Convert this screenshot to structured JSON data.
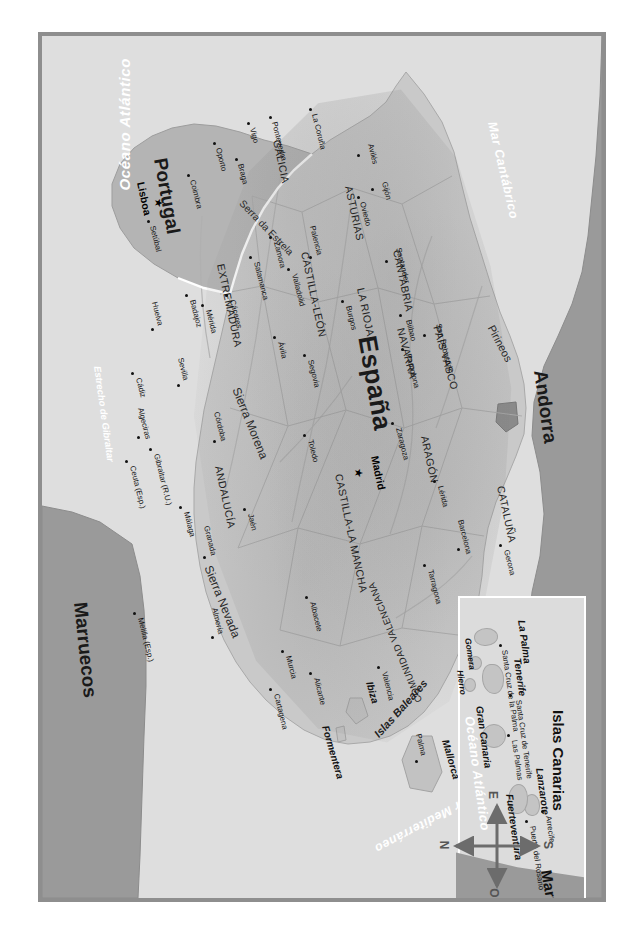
{
  "map": {
    "title": "Mapa físico-político de España y Portugal",
    "countries": [
      {
        "name": "España",
        "style": "country"
      },
      {
        "name": "Portugal",
        "style": "nation"
      },
      {
        "name": "Andorra",
        "style": "nation"
      },
      {
        "name": "Marruecos",
        "style": "nation"
      }
    ],
    "seas": [
      {
        "name": "Mar Cantábrico"
      },
      {
        "name": "Mar Mediterráneo"
      },
      {
        "name": "Océano Atlántico"
      },
      {
        "name": "Estrecho de Gibraltar"
      }
    ],
    "regions": [
      "GALICIA",
      "ASTURIAS",
      "CANTABRIA",
      "PAÍS VASCO",
      "NAVARRA",
      "LA RIOJA",
      "ARAGÓN",
      "CATALUÑA",
      "CASTILLA-LEÓN",
      "COMUNIDAD VALENCIANA",
      "EXTREMADURA",
      "CASTILLA-LA MANCHA",
      "ANDALUCÍA"
    ],
    "mountain_ranges": [
      "Pirineos",
      "Serra da Estrela",
      "Sierra Morena",
      "Sierra Nevada"
    ],
    "capitals": [
      {
        "name": "Madrid",
        "country": "España"
      },
      {
        "name": "Lisboa",
        "country": "Portugal"
      }
    ],
    "cities": [
      "La Coruña",
      "Pontevedra",
      "Vigo",
      "Oporto",
      "Braga",
      "Coimbra",
      "Setúbal",
      "Avilés",
      "Gijón",
      "Oviedo",
      "Santander",
      "San Sebastián",
      "Bilbao",
      "Pamplona",
      "Burgos",
      "Palencia",
      "Valladolid",
      "Zamora",
      "Salamanca",
      "Ávila",
      "Segovia",
      "Zaragoza",
      "Lérida",
      "Gerona",
      "Barcelona",
      "Tarragona",
      "Valencia",
      "Alicante",
      "Albacete",
      "Murcia",
      "Cartagena",
      "Almería",
      "Granada",
      "Málaga",
      "Jaén",
      "Córdoba",
      "Sevilla",
      "Huelva",
      "Cádiz",
      "Algeciras",
      "Toledo",
      "Cáceres",
      "Mérida",
      "Badajoz",
      "Gibraltar (R.U.)",
      "Ceuta (Esp.)",
      "Melilla (Esp.)"
    ],
    "balearic": {
      "archipelago": "Islas Baleares",
      "islands": [
        "Menorca",
        "Mallorca",
        "Ibiza",
        "Formentera"
      ],
      "cities": [
        "Palma"
      ]
    },
    "inset": {
      "title": "Islas Canarias",
      "islands": [
        "La Palma",
        "Tenerife",
        "Gomera",
        "Hierro",
        "Gran Canaria",
        "Lanzarote",
        "Fuerteventura"
      ],
      "cities": [
        "Santa Cruz de la Palma",
        "Santa Cruz de Tenerife",
        "Las Palmas",
        "Arrecife",
        "Puerto del Rosario"
      ],
      "ocean": "Océano Atlántico",
      "neighbour": "Marruecos"
    },
    "compass": {
      "north": "N",
      "south": "S",
      "east": "E",
      "west": "O"
    },
    "colors": {
      "frame": "#8e8e8e",
      "sea": "#dedede",
      "spain": "#c9c9c9",
      "portugal": "#b4b4b4",
      "foreign": "#9a9a9a",
      "sea_label": "#ffffff",
      "text": "#1a1a1a"
    }
  }
}
